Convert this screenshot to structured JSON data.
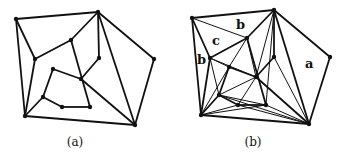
{
  "figure_a": {
    "caption": "(a)",
    "vertices": {
      "A": [
        16,
        19
      ],
      "B": [
        98,
        12
      ],
      "C": [
        154,
        59
      ],
      "D": [
        135,
        125
      ],
      "E": [
        25,
        116
      ],
      "F": [
        35,
        59
      ],
      "G": [
        71,
        40
      ],
      "H": [
        99,
        58
      ],
      "I": [
        81,
        79
      ],
      "J": [
        53,
        69
      ],
      "K": [
        43,
        97
      ],
      "L": [
        62,
        107
      ],
      "M": [
        90,
        107
      ]
    },
    "edges": [
      [
        "A",
        "B"
      ],
      [
        "B",
        "C"
      ],
      [
        "C",
        "D"
      ],
      [
        "D",
        "E"
      ],
      [
        "E",
        "A"
      ],
      [
        "A",
        "F"
      ],
      [
        "F",
        "G"
      ],
      [
        "G",
        "B"
      ],
      [
        "F",
        "E"
      ],
      [
        "B",
        "H"
      ],
      [
        "H",
        "I"
      ],
      [
        "B",
        "D"
      ],
      [
        "I",
        "D"
      ],
      [
        "G",
        "M"
      ],
      [
        "I",
        "J"
      ],
      [
        "J",
        "K"
      ],
      [
        "K",
        "L"
      ],
      [
        "L",
        "M"
      ],
      [
        "K",
        "E"
      ]
    ]
  },
  "figure_b": {
    "caption": "(b)",
    "labels": [
      {
        "text": "b",
        "x": 236,
        "y": 29
      },
      {
        "text": "c",
        "x": 212,
        "y": 45
      },
      {
        "text": "b",
        "x": 197,
        "y": 64
      },
      {
        "text": "a",
        "x": 305,
        "y": 68
      }
    ],
    "vertices": {
      "A": [
        192,
        18
      ],
      "B": [
        274,
        10
      ],
      "C": [
        330,
        57
      ],
      "D": [
        309,
        124
      ],
      "E": [
        201,
        115
      ],
      "F": [
        210,
        58
      ],
      "G": [
        247,
        38
      ],
      "H": [
        274,
        57
      ],
      "I": [
        256,
        77
      ],
      "J": [
        229,
        67
      ],
      "K": [
        219,
        95
      ],
      "L": [
        238,
        105
      ],
      "M": [
        266,
        105
      ]
    },
    "edges": [
      [
        "A",
        "B"
      ],
      [
        "B",
        "C"
      ],
      [
        "C",
        "D"
      ],
      [
        "D",
        "E"
      ],
      [
        "E",
        "A"
      ],
      [
        "A",
        "F"
      ],
      [
        "F",
        "G"
      ],
      [
        "G",
        "B"
      ],
      [
        "F",
        "E"
      ],
      [
        "B",
        "H"
      ],
      [
        "H",
        "I"
      ],
      [
        "B",
        "D"
      ],
      [
        "I",
        "D"
      ],
      [
        "G",
        "M"
      ],
      [
        "I",
        "J"
      ],
      [
        "J",
        "K"
      ],
      [
        "K",
        "L"
      ],
      [
        "L",
        "M"
      ],
      [
        "K",
        "E"
      ]
    ],
    "thin_edges": [
      [
        "A",
        "G"
      ],
      [
        "F",
        "J"
      ],
      [
        "F",
        "K"
      ],
      [
        "F",
        "I"
      ],
      [
        "G",
        "J"
      ],
      [
        "G",
        "I"
      ],
      [
        "B",
        "I"
      ],
      [
        "H",
        "D"
      ],
      [
        "I",
        "K"
      ],
      [
        "I",
        "L"
      ],
      [
        "J",
        "E"
      ],
      [
        "K",
        "M"
      ],
      [
        "E",
        "L"
      ],
      [
        "E",
        "M"
      ],
      [
        "L",
        "D"
      ],
      [
        "M",
        "D"
      ],
      [
        "K",
        "D"
      ],
      [
        "B",
        "M"
      ]
    ]
  }
}
